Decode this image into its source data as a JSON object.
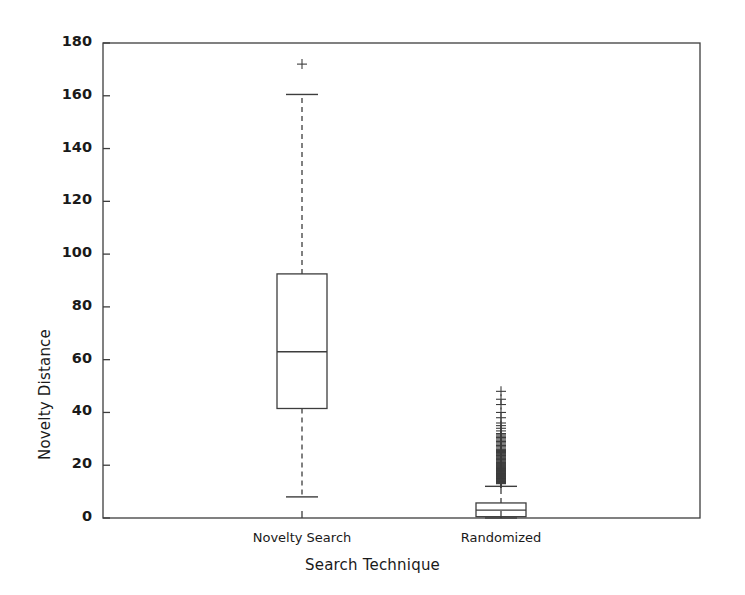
{
  "chart_data": {
    "type": "box",
    "title": "",
    "xlabel": "Search Technique",
    "ylabel": "Novelty Distance",
    "categories": [
      "Novelty Search",
      "Randomized"
    ],
    "ylim": [
      0,
      180
    ],
    "yticks": [
      0,
      20,
      40,
      60,
      80,
      100,
      120,
      140,
      160,
      180
    ],
    "ytick_labels": [
      "0",
      "20",
      "40",
      "60",
      "80",
      "100",
      "120",
      "140",
      "160",
      "180"
    ],
    "xlim": [
      0,
      3
    ],
    "grid": false,
    "legend": null,
    "boxes": [
      {
        "name": "Novelty Search",
        "x": 1,
        "whisker_low": 8,
        "q1": 41.5,
        "median": 63,
        "q3": 92.5,
        "whisker_high": 160.5,
        "outliers": [
          172
        ]
      },
      {
        "name": "Randomized",
        "x": 2,
        "whisker_low": 0,
        "q1": 0.5,
        "median": 3,
        "q3": 5.7,
        "whisker_high": 12,
        "outliers": [
          48,
          45,
          43,
          40,
          38,
          36,
          35,
          34,
          33,
          32,
          31.5,
          31,
          30.5,
          30,
          29.5,
          29,
          28.5,
          28,
          27.5,
          27,
          26.5,
          26,
          25.6,
          25.2,
          24.8,
          24.4,
          24,
          23.7,
          23.4,
          23.1,
          22.8,
          22.5,
          22.2,
          21.9,
          21.6,
          21.3,
          21,
          20.8,
          20.6,
          20.4,
          20.2,
          20,
          19.8,
          19.6,
          19.4,
          19.2,
          19,
          18.9,
          18.8,
          18.7,
          18.6,
          18.5,
          18.4,
          18.3,
          18.2,
          18.1,
          18,
          17.9,
          17.8,
          17.7,
          17.6,
          17.5,
          17.4,
          17.3,
          17.2,
          17.1,
          17,
          16.9,
          16.8,
          16.7,
          16.6,
          16.5,
          16.4,
          16.3,
          16.2,
          16.1,
          16,
          15.9,
          15.8,
          15.7,
          15.6,
          15.5,
          15.4,
          15.3,
          15.2,
          15.1,
          15,
          14.9,
          14.8,
          14.7,
          14.6,
          14.5,
          14.4,
          14.3,
          14.2,
          14.1,
          14,
          13.9,
          13.8,
          13.7,
          13.6,
          13.5,
          13.4,
          13.3,
          13.2,
          13.1,
          13
        ]
      }
    ],
    "marker": "+",
    "line_color": "#3d3d3d",
    "marker_color": "#3d3d3d",
    "background": "#ffffff"
  }
}
